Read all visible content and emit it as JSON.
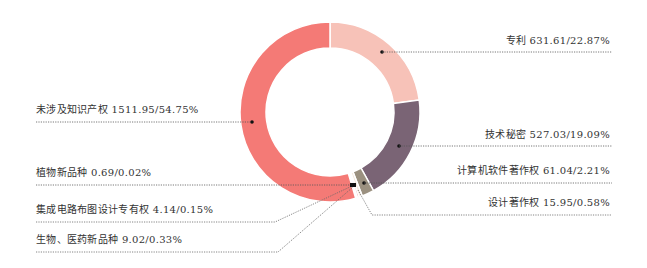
{
  "chart_data": {
    "type": "pie",
    "variant": "donut",
    "title": "",
    "unit_note": "value/percentage",
    "slices": [
      {
        "label": "专利",
        "value": 631.61,
        "percent": 22.87,
        "color": "#f7c2b8",
        "text": "专利 631.61/22.87%"
      },
      {
        "label": "技术秘密",
        "value": 527.03,
        "percent": 19.09,
        "color": "#7a6475",
        "text": "技术秘密 527.03/19.09%"
      },
      {
        "label": "计算机软件著作权",
        "value": 61.04,
        "percent": 2.21,
        "color": "#9b9180",
        "text": "计算机软件著作权 61.04/2.21%"
      },
      {
        "label": "设计著作权",
        "value": 15.95,
        "percent": 0.58,
        "color": "#f4e9dc",
        "text": "设计著作权 15.95/0.58%"
      },
      {
        "label": "生物、医药新品种",
        "value": 9.02,
        "percent": 0.33,
        "color": "#e85a5a",
        "text": "生物、医药新品种 9.02/0.33%"
      },
      {
        "label": "集成电路布图设计专有权",
        "value": 4.14,
        "percent": 0.15,
        "color": "#c94848",
        "text": "集成电路布图设计专有权 4.14/0.15%"
      },
      {
        "label": "植物新品种",
        "value": 0.69,
        "percent": 0.02,
        "color": "#222222",
        "text": "植物新品种 0.69/0.02%"
      },
      {
        "label": "未涉及知识产权",
        "value": 1511.95,
        "percent": 54.75,
        "color": "#f47a76",
        "text": "未涉及知识产权 1511.95/54.75%"
      }
    ],
    "legend_position": "callout-labels"
  }
}
